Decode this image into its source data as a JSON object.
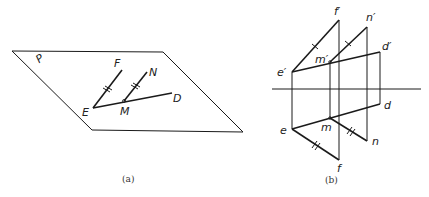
{
  "figure_a": {
    "caption": "(a)",
    "plane_label": "P",
    "plane": [
      [
        12,
        51
      ],
      [
        163,
        52
      ],
      [
        243,
        132
      ],
      [
        92,
        130
      ]
    ],
    "points": {
      "E": {
        "label": "E",
        "x": 93,
        "y": 108
      },
      "F": {
        "label": "F",
        "x": 122,
        "y": 70
      },
      "M": {
        "label": "M",
        "x": 124,
        "y": 101
      },
      "N": {
        "label": "N",
        "x": 147,
        "y": 72
      },
      "D": {
        "label": "D",
        "x": 172,
        "y": 93
      }
    },
    "segments": [
      [
        "E",
        "F"
      ],
      [
        "M",
        "N"
      ],
      [
        "E",
        "D"
      ]
    ],
    "parallel_marks": [
      [
        "E",
        "F"
      ],
      [
        "M",
        "N"
      ]
    ]
  },
  "figure_b": {
    "caption": "(b)",
    "axis": {
      "x1": 272,
      "x2": 421,
      "y": 89
    },
    "front_view": {
      "e": {
        "label": "e′",
        "x": 292,
        "y": 72
      },
      "f": {
        "label": "f′",
        "x": 339,
        "y": 20
      },
      "m": {
        "label": "m′",
        "x": 330,
        "y": 62
      },
      "n": {
        "label": "n′",
        "x": 367,
        "y": 27
      },
      "d": {
        "label": "d′",
        "x": 380,
        "y": 52
      }
    },
    "top_view": {
      "e": {
        "label": "e",
        "x": 292,
        "y": 129
      },
      "f": {
        "label": "f",
        "x": 339,
        "y": 160
      },
      "m": {
        "label": "m",
        "x": 330,
        "y": 118
      },
      "n": {
        "label": "n",
        "x": 367,
        "y": 141
      },
      "d": {
        "label": "d",
        "x": 380,
        "y": 104
      }
    }
  }
}
